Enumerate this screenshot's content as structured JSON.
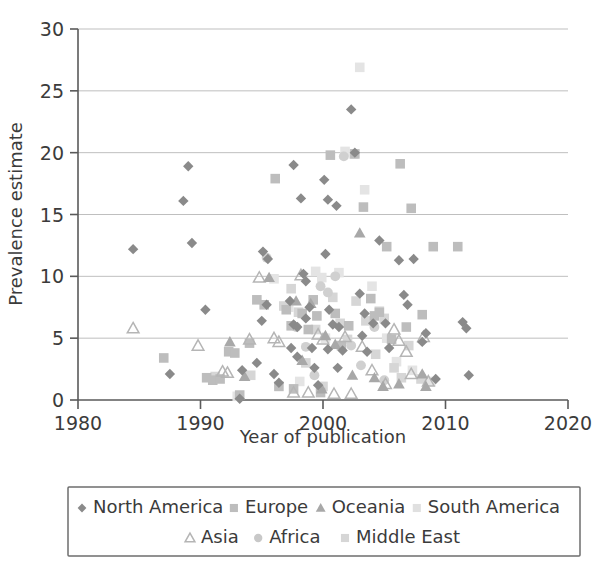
{
  "chart_data": {
    "type": "scatter",
    "title": "",
    "xlabel": "Year of publication",
    "ylabel": "Prevalence estimate",
    "xlim": [
      1980,
      2020
    ],
    "ylim": [
      0,
      30
    ],
    "xticks": [
      "1980",
      "1990",
      "2000",
      "2010",
      "2020"
    ],
    "xtick_values": [
      1980,
      1990,
      2000,
      2010,
      2020
    ],
    "yticks": [
      "0",
      "5",
      "10",
      "15",
      "20",
      "25",
      "30"
    ],
    "ytick_values": [
      0,
      5,
      10,
      15,
      20,
      25,
      30
    ],
    "grid": "horizontal",
    "legend_position": "bottom",
    "series": [
      {
        "name": "North America",
        "marker": "diamond",
        "color": "#8a8a8a",
        "points": [
          [
            1984.5,
            12.2
          ],
          [
            1987.5,
            2.1
          ],
          [
            1989.0,
            18.9
          ],
          [
            1988.6,
            16.1
          ],
          [
            1989.3,
            12.7
          ],
          [
            1990.4,
            7.3
          ],
          [
            1993.2,
            0.1
          ],
          [
            1993.4,
            2.4
          ],
          [
            1994.6,
            3.0
          ],
          [
            1995.1,
            12.0
          ],
          [
            1995.5,
            11.4
          ],
          [
            1995.0,
            6.4
          ],
          [
            1995.4,
            7.7
          ],
          [
            1996.0,
            2.1
          ],
          [
            1996.4,
            1.4
          ],
          [
            1997.6,
            19.0
          ],
          [
            1997.3,
            8.0
          ],
          [
            1997.6,
            6.1
          ],
          [
            1997.9,
            5.9
          ],
          [
            1997.4,
            4.2
          ],
          [
            1997.9,
            3.5
          ],
          [
            1998.2,
            16.3
          ],
          [
            1998.4,
            10.2
          ],
          [
            1998.6,
            9.6
          ],
          [
            1998.9,
            7.5
          ],
          [
            1998.6,
            6.6
          ],
          [
            1999.1,
            4.2
          ],
          [
            1999.3,
            2.6
          ],
          [
            1999.6,
            1.2
          ],
          [
            2000.1,
            17.8
          ],
          [
            2000.4,
            16.2
          ],
          [
            2000.2,
            11.8
          ],
          [
            2000.5,
            7.3
          ],
          [
            2000.8,
            6.1
          ],
          [
            2000.4,
            4.1
          ],
          [
            2001.1,
            15.7
          ],
          [
            2001.3,
            5.9
          ],
          [
            2001.6,
            4.0
          ],
          [
            2001.2,
            2.6
          ],
          [
            2002.3,
            23.5
          ],
          [
            2002.6,
            20.0
          ],
          [
            2003.0,
            8.6
          ],
          [
            2003.4,
            7.0
          ],
          [
            2003.2,
            5.2
          ],
          [
            2003.6,
            3.9
          ],
          [
            2004.1,
            6.2
          ],
          [
            2004.6,
            12.9
          ],
          [
            2005.1,
            6.2
          ],
          [
            2005.4,
            4.2
          ],
          [
            2006.2,
            11.3
          ],
          [
            2006.6,
            8.5
          ],
          [
            2006.9,
            7.7
          ],
          [
            2007.4,
            11.4
          ],
          [
            2008.1,
            4.7
          ],
          [
            2008.4,
            5.4
          ],
          [
            2009.2,
            1.7
          ],
          [
            2011.4,
            6.3
          ],
          [
            2011.7,
            5.8
          ],
          [
            2011.9,
            2.0
          ]
        ]
      },
      {
        "name": "Europe",
        "marker": "square",
        "color": "#bdbdbd",
        "points": [
          [
            1987.0,
            3.4
          ],
          [
            1990.5,
            1.8
          ],
          [
            1991.0,
            1.6
          ],
          [
            1991.6,
            1.7
          ],
          [
            1992.3,
            3.9
          ],
          [
            1992.8,
            3.8
          ],
          [
            1993.2,
            0.4
          ],
          [
            1994.0,
            4.6
          ],
          [
            1994.6,
            8.1
          ],
          [
            1995.2,
            7.7
          ],
          [
            1996.1,
            17.9
          ],
          [
            1996.4,
            1.1
          ],
          [
            1997.0,
            7.3
          ],
          [
            1997.4,
            6.0
          ],
          [
            1997.6,
            0.9
          ],
          [
            1998.3,
            7.0
          ],
          [
            1998.8,
            5.7
          ],
          [
            1999.2,
            8.1
          ],
          [
            1999.5,
            6.8
          ],
          [
            1999.8,
            0.6
          ],
          [
            2000.6,
            19.8
          ],
          [
            2001.0,
            7.0
          ],
          [
            2001.5,
            4.4
          ],
          [
            2002.1,
            6.0
          ],
          [
            2002.6,
            19.9
          ],
          [
            2003.3,
            15.6
          ],
          [
            2003.9,
            8.2
          ],
          [
            2004.2,
            6.8
          ],
          [
            2004.6,
            7.1
          ],
          [
            2005.2,
            12.4
          ],
          [
            2005.6,
            4.9
          ],
          [
            2006.3,
            19.1
          ],
          [
            2006.8,
            5.9
          ],
          [
            2007.2,
            15.5
          ],
          [
            2008.1,
            6.9
          ],
          [
            2009.0,
            12.4
          ],
          [
            2011.0,
            12.4
          ]
        ]
      },
      {
        "name": "Oceania",
        "marker": "triangle",
        "color": "#a8a8a8",
        "points": [
          [
            1992.4,
            4.7
          ],
          [
            1993.6,
            1.9
          ],
          [
            1995.6,
            9.9
          ],
          [
            1997.8,
            8.0
          ],
          [
            1998.3,
            3.2
          ],
          [
            1999.0,
            7.8
          ],
          [
            1999.9,
            0.9
          ],
          [
            2000.2,
            5.2
          ],
          [
            2001.0,
            4.5
          ],
          [
            2002.4,
            2.0
          ],
          [
            2003.0,
            13.5
          ],
          [
            2004.2,
            1.8
          ],
          [
            2004.9,
            1.1
          ],
          [
            2006.2,
            1.3
          ],
          [
            2008.1,
            2.1
          ],
          [
            2008.4,
            1.1
          ]
        ]
      },
      {
        "name": "South America",
        "marker": "square",
        "color": "#e4e4e4",
        "points": [
          [
            1993.0,
            0.3
          ],
          [
            1996.0,
            9.8
          ],
          [
            1997.2,
            7.5
          ],
          [
            1998.1,
            1.5
          ],
          [
            1999.4,
            10.4
          ],
          [
            1999.9,
            9.9
          ],
          [
            2000.2,
            5.0
          ],
          [
            2001.3,
            10.3
          ],
          [
            2001.8,
            20.1
          ],
          [
            2002.5,
            19.9
          ],
          [
            2003.0,
            26.9
          ],
          [
            2003.4,
            17.0
          ],
          [
            2004.0,
            9.2
          ],
          [
            2004.6,
            7.2
          ],
          [
            2005.2,
            5.0
          ],
          [
            2006.0,
            3.1
          ],
          [
            2007.3,
            2.4
          ],
          [
            2008.8,
            1.5
          ]
        ]
      },
      {
        "name": "Asia",
        "marker": "triangle-open",
        "color": "#b5b5b5",
        "points": [
          [
            1984.5,
            5.8
          ],
          [
            1989.8,
            4.4
          ],
          [
            1991.8,
            2.3
          ],
          [
            1992.2,
            2.2
          ],
          [
            1994.0,
            4.9
          ],
          [
            1994.8,
            9.9
          ],
          [
            1996.0,
            5.0
          ],
          [
            1996.4,
            4.7
          ],
          [
            1997.6,
            0.6
          ],
          [
            1998.2,
            10.1
          ],
          [
            1998.8,
            0.6
          ],
          [
            1999.6,
            5.3
          ],
          [
            2000.0,
            4.9
          ],
          [
            2000.9,
            0.5
          ],
          [
            2001.8,
            5.1
          ],
          [
            2002.3,
            0.5
          ],
          [
            2003.2,
            4.3
          ],
          [
            2004.0,
            2.4
          ],
          [
            2005.1,
            1.3
          ],
          [
            2005.8,
            5.7
          ],
          [
            2006.2,
            4.8
          ],
          [
            2006.8,
            3.9
          ],
          [
            2007.2,
            2.1
          ],
          [
            2008.2,
            5.1
          ],
          [
            2008.6,
            1.5
          ]
        ]
      },
      {
        "name": "Africa",
        "marker": "circle",
        "color": "#d0d0d0",
        "points": [
          [
            1995.4,
            11.5
          ],
          [
            1997.8,
            5.9
          ],
          [
            1998.6,
            4.3
          ],
          [
            1999.3,
            2.0
          ],
          [
            1999.8,
            9.2
          ],
          [
            2000.4,
            8.7
          ],
          [
            2001.0,
            10.0
          ],
          [
            2001.7,
            19.7
          ],
          [
            2002.3,
            4.4
          ],
          [
            2003.1,
            2.8
          ],
          [
            2004.2,
            5.9
          ],
          [
            2005.0,
            1.6
          ]
        ]
      },
      {
        "name": "Middle East",
        "marker": "square",
        "color": "#d6d6d6",
        "points": [
          [
            1991.2,
            1.9
          ],
          [
            1994.1,
            2.0
          ],
          [
            1996.8,
            7.6
          ],
          [
            1997.4,
            9.0
          ],
          [
            1998.0,
            7.1
          ],
          [
            1998.6,
            3.0
          ],
          [
            1999.4,
            5.7
          ],
          [
            2000.0,
            1.1
          ],
          [
            2000.8,
            8.3
          ],
          [
            2001.4,
            6.2
          ],
          [
            2002.0,
            4.9
          ],
          [
            2002.7,
            8.0
          ],
          [
            2003.5,
            6.4
          ],
          [
            2004.3,
            3.7
          ],
          [
            2005.0,
            6.6
          ],
          [
            2005.8,
            2.6
          ],
          [
            2006.4,
            1.8
          ],
          [
            2007.0,
            4.4
          ],
          [
            2008.0,
            1.7
          ]
        ]
      }
    ]
  },
  "legend": {
    "row1": [
      {
        "label": "North America",
        "marker": "diamond",
        "color": "#8a8a8a"
      },
      {
        "label": "Europe",
        "marker": "square",
        "color": "#bdbdbd"
      },
      {
        "label": "Oceania",
        "marker": "triangle",
        "color": "#a8a8a8"
      },
      {
        "label": "South America",
        "marker": "square",
        "color": "#e0e0e0"
      }
    ],
    "row2": [
      {
        "label": "Asia",
        "marker": "triangle-open",
        "color": "#b5b5b5"
      },
      {
        "label": "Africa",
        "marker": "circle",
        "color": "#c8c8c8"
      },
      {
        "label": "Middle East",
        "marker": "square",
        "color": "#d6d6d6"
      }
    ]
  },
  "colors": {
    "axis": "#5a5a5a",
    "grid": "#b8b8b8",
    "text": "#3b3b3b",
    "background": "#ffffff"
  }
}
